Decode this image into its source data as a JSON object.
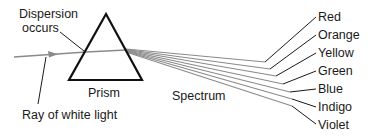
{
  "diagram": {
    "labels": {
      "dispersion_line1": "Dispersion",
      "dispersion_line2": "occurs",
      "prism": "Prism",
      "spectrum": "Spectrum",
      "ray": "Ray of white light"
    },
    "colors": [
      "Red",
      "Orange",
      "Yellow",
      "Green",
      "Blue",
      "Indigo",
      "Violet"
    ],
    "stroke_color": "#1a1a1a",
    "ray_color": "#8a8a8a"
  }
}
